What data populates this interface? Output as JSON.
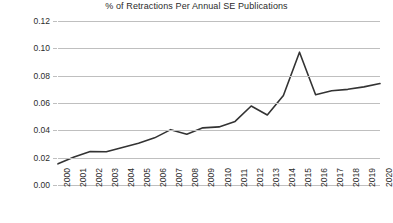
{
  "chart_data": {
    "type": "line",
    "title": "% of Retractions Per Annual SE Publications",
    "xlabel": "",
    "ylabel": "% Retracted",
    "x": [
      2000,
      2001,
      2002,
      2003,
      2004,
      2005,
      2006,
      2007,
      2008,
      2009,
      2010,
      2011,
      2012,
      2013,
      2014,
      2015,
      2016,
      2017,
      2018,
      2019,
      2020
    ],
    "categories": [
      "2000",
      "2001",
      "2002",
      "2003",
      "2004",
      "2005",
      "2006",
      "2007",
      "2008",
      "2009",
      "2010",
      "2011",
      "2012",
      "2013",
      "2014",
      "2015",
      "2016",
      "2017",
      "2018",
      "2019",
      "2020"
    ],
    "values": [
      0.0155,
      0.0205,
      0.0245,
      0.0243,
      0.0275,
      0.0305,
      0.0345,
      0.0405,
      0.0372,
      0.0418,
      0.0425,
      0.0465,
      0.0578,
      0.0512,
      0.0655,
      0.0972,
      0.066,
      0.069,
      0.07,
      0.0718,
      0.0742
    ],
    "series": [
      {
        "name": "% Retracted",
        "values": [
          0.0155,
          0.0205,
          0.0245,
          0.0243,
          0.0275,
          0.0305,
          0.0345,
          0.0405,
          0.0372,
          0.0418,
          0.0425,
          0.0465,
          0.0578,
          0.0512,
          0.0655,
          0.0972,
          0.066,
          0.069,
          0.07,
          0.0718,
          0.0742
        ]
      }
    ],
    "ylim": [
      0.0,
      0.12
    ],
    "yticks": [
      0.0,
      0.02,
      0.04,
      0.06,
      0.08,
      0.1,
      0.12
    ],
    "ytick_labels": [
      "0.00",
      "0.02",
      "0.04",
      "0.06",
      "0.08",
      "0.10",
      "0.12"
    ],
    "grid": true,
    "grid_axis": "y",
    "legend": false,
    "legend_position": "none",
    "line_color": "#333333",
    "grid_color": "#bfbfbf",
    "background_color": "#ffffff",
    "xtick_rotation": 90
  }
}
